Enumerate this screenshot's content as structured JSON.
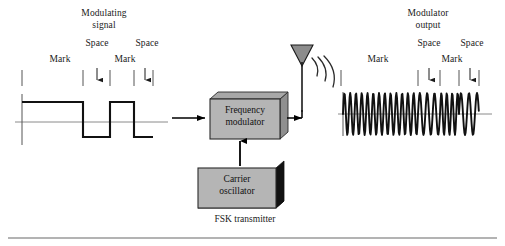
{
  "figure": {
    "title_left": {
      "line1": "Modulating",
      "line2": "signal"
    },
    "title_right": {
      "line1": "Modulator",
      "line2": "output"
    },
    "caption": "FSK transmitter",
    "colors": {
      "box_fill": "#b3b3b3",
      "box_side_fill": "#8c8c8c",
      "box_shadow_dark": "#111111",
      "antenna_fill": "#8c8c8c",
      "stroke": "#000000",
      "axis_gray": "#8a8a8a",
      "rule_gray": "#9a9a9a"
    }
  },
  "left_waveform": {
    "marks": [
      {
        "label": "Mark",
        "x": 60
      },
      {
        "label": "Space",
        "x": 97
      },
      {
        "label": "Mark",
        "x": 122
      },
      {
        "label": "Space",
        "x": 145
      }
    ],
    "ticks_x": [
      22,
      83,
      110,
      134,
      153
    ],
    "arrows_x": [
      97,
      145
    ],
    "signal": {
      "type": "digital-square",
      "high_level": "mark",
      "low_level": "space",
      "segments": [
        {
          "state": "mark",
          "x_start": 22,
          "x_end": 83
        },
        {
          "state": "space",
          "x_start": 83,
          "x_end": 110
        },
        {
          "state": "mark",
          "x_start": 110,
          "x_end": 134
        },
        {
          "state": "space",
          "x_start": 134,
          "x_end": 153
        }
      ]
    }
  },
  "right_waveform": {
    "marks": [
      {
        "label": "Mark",
        "x": 375
      },
      {
        "label": "Space",
        "x": 423
      },
      {
        "label": "Mark",
        "x": 448
      },
      {
        "label": "Space",
        "x": 470
      }
    ],
    "ticks_x": [
      341,
      418,
      440,
      459,
      479
    ],
    "arrows_x": [
      423,
      470
    ],
    "signal": {
      "type": "fsk-sine",
      "segments": [
        {
          "state": "mark",
          "x_start": 343,
          "x_end": 418,
          "cycles": 13
        },
        {
          "state": "space",
          "x_start": 418,
          "x_end": 440,
          "cycles": 3
        },
        {
          "state": "mark",
          "x_start": 440,
          "x_end": 459,
          "cycles": 3.5
        },
        {
          "state": "space",
          "x_start": 459,
          "x_end": 479,
          "cycles": 2.5
        }
      ]
    }
  },
  "blocks": [
    {
      "id": "frequency-modulator",
      "line1": "Frequency",
      "line2": "modulator",
      "x": 210,
      "y": 99,
      "w": 70,
      "h": 40
    },
    {
      "id": "carrier-oscillator",
      "line1": "Carrier",
      "line2": "oscillator",
      "x": 198,
      "y": 168,
      "w": 78,
      "h": 40
    }
  ],
  "antenna": {
    "name": "transmit-antenna",
    "apex_x": 302,
    "top_y": 44,
    "stem_bottom_y": 110,
    "wave_arcs": 3
  },
  "connectors": [
    {
      "name": "modulating-signal-input",
      "from": "left-waveform",
      "to": "frequency-modulator"
    },
    {
      "name": "carrier-to-modulator",
      "from": "carrier-oscillator",
      "to": "frequency-modulator"
    },
    {
      "name": "modulator-output-to-antenna",
      "from": "frequency-modulator",
      "to": "antenna"
    }
  ]
}
